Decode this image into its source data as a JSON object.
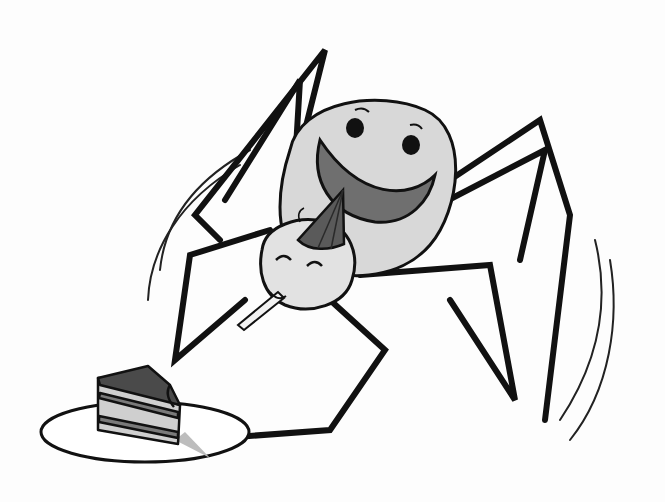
{
  "illustration": {
    "subject": "cartoon spider wearing a party hat, blowing a party horn, beside a slice of cake on a plate",
    "palette": {
      "background": "#fdfdfd",
      "ink": "#111111",
      "body": "#d8d8d8",
      "mouth": "#6f6f6f",
      "hat": "#5a5a5a",
      "cake_top": "#4a4a4a",
      "cake_layer_light": "#cfcfcf",
      "cake_layer_dark": "#7a7a7a",
      "plate": "#ffffff",
      "shadow": "#bdbdbd"
    }
  }
}
